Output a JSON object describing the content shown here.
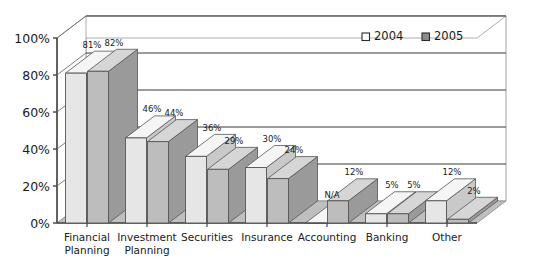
{
  "chart_data": {
    "type": "bar",
    "title": "",
    "subtitle": "",
    "xlabel": "",
    "ylabel": "",
    "ylim": [
      0,
      100
    ],
    "grid": true,
    "y_ticks": [
      "0%",
      "20%",
      "40%",
      "60%",
      "80%",
      "100%"
    ],
    "y_tick_values": [
      0,
      20,
      40,
      60,
      80,
      100
    ],
    "legend_position": "top-right",
    "categories": [
      "Financial Planning",
      "Investment Planning",
      "Securities",
      "Insurance",
      "Accounting",
      "Banking",
      "Other"
    ],
    "category_lines": [
      [
        "Financial",
        "Planning"
      ],
      [
        "Investment",
        "Planning"
      ],
      [
        "Securities",
        ""
      ],
      [
        "Insurance",
        ""
      ],
      [
        "Accounting",
        ""
      ],
      [
        "Banking",
        ""
      ],
      [
        "Other",
        ""
      ]
    ],
    "series": [
      {
        "name": "2004",
        "color": "#e6e6e6",
        "values": [
          81,
          46,
          36,
          30,
          0,
          5,
          12
        ],
        "labels": [
          "81%",
          "46%",
          "36%",
          "30%",
          "N/A",
          "5%",
          "12%"
        ]
      },
      {
        "name": "2005",
        "color": "#bdbdbd",
        "values": [
          82,
          44,
          29,
          24,
          12,
          5,
          2
        ],
        "labels": [
          "82%",
          "44%",
          "29%",
          "24%",
          "12%",
          "5%",
          "2%"
        ]
      }
    ]
  },
  "legend": {
    "items": [
      {
        "label": "2004",
        "swatch": "#ffffff"
      },
      {
        "label": "2005",
        "swatch": "#8c8c8c"
      }
    ]
  },
  "colors": {
    "series_2004_front": "#e6e6e6",
    "series_2004_top": "#f5f5f5",
    "series_2004_side": "#c9c9c9",
    "series_2005_front": "#bdbdbd",
    "series_2005_top": "#d6d6d6",
    "series_2005_side": "#9a9a9a",
    "floor": "#bfbfbf",
    "wall": "#ffffff",
    "axis": "#444444",
    "grid": "#3a3a3a",
    "outline": "#555555",
    "text": "#1a1a1a"
  }
}
